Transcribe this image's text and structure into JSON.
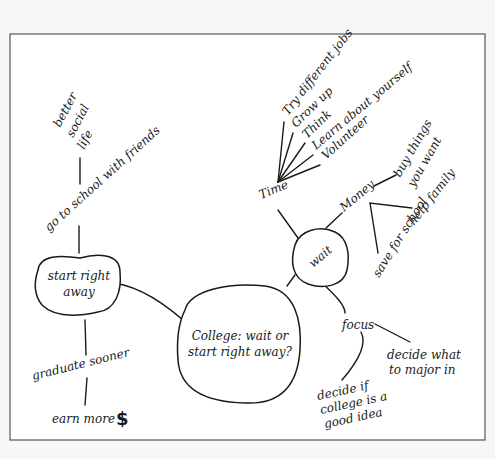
{
  "diagram": {
    "type": "mind-map",
    "colors": {
      "background": "#f7f7f7",
      "frame_fill": "#ffffff",
      "frame_border": "#555555",
      "ink": "#1a1a1a"
    },
    "center": {
      "line1": "College: wait or",
      "line2": "start right away?"
    },
    "start_right_away": {
      "line1": "start right",
      "line2": "away",
      "branches": {
        "friends": "go to school with friends",
        "social": [
          "better",
          "social",
          "life"
        ],
        "graduate": "graduate sooner",
        "earn": "earn more",
        "dollar": "$"
      }
    },
    "wait": {
      "label": "wait",
      "time": {
        "label": "Time",
        "items": [
          "Try different jobs",
          "Grow up",
          "Think",
          "Learn about yourself",
          "Volunteer"
        ]
      },
      "money": {
        "label": "Money",
        "items": {
          "buy": [
            "buy things",
            "you want"
          ],
          "help": "help family",
          "save": "save for school"
        }
      },
      "focus": {
        "label": "focus",
        "items": {
          "major": [
            "decide what",
            "to major in"
          ],
          "college": [
            "decide if",
            "college is a",
            "good idea"
          ]
        }
      }
    }
  }
}
